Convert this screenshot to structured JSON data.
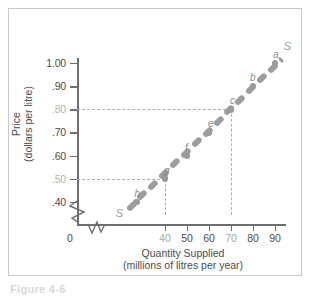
{
  "figure": {
    "caption": "Figure 4-6"
  },
  "chart_data": {
    "type": "line",
    "title": "",
    "xlabel": "Quantity Supplied",
    "xlabel_sub": "(millions of litres per year)",
    "ylabel": "Price",
    "ylabel_sub": "(dollars per litre)",
    "curve_label": "S",
    "curve_label_start": "S",
    "xlim": [
      0,
      95
    ],
    "ylim": [
      0.33,
      1.06
    ],
    "grid": false,
    "legend": "none",
    "axis_break_x": true,
    "axis_break_y": true,
    "xticks": [
      {
        "value": 0,
        "label": "0",
        "dim": false
      },
      {
        "value": 40,
        "label": "40",
        "dim": true
      },
      {
        "value": 50,
        "label": "50",
        "dim": false
      },
      {
        "value": 60,
        "label": "60",
        "dim": false
      },
      {
        "value": 70,
        "label": "70",
        "dim": true
      },
      {
        "value": 80,
        "label": "80",
        "dim": false
      },
      {
        "value": 90,
        "label": "90",
        "dim": false
      }
    ],
    "yticks": [
      {
        "value": 1.0,
        "label": "1.00",
        "dim": false
      },
      {
        "value": 0.9,
        "label": ".90",
        "dim": false
      },
      {
        "value": 0.8,
        "label": ".80",
        "dim": true
      },
      {
        "value": 0.7,
        "label": ".70",
        "dim": false
      },
      {
        "value": 0.6,
        "label": ".60",
        "dim": false
      },
      {
        "value": 0.5,
        "label": ".50",
        "dim": true
      },
      {
        "value": 0.4,
        "label": ".40",
        "dim": false
      }
    ],
    "points": [
      {
        "label": "h",
        "x": 27,
        "y": 0.4,
        "lab_dx": -2,
        "lab_dy": -14
      },
      {
        "label": "g",
        "x": 40,
        "y": 0.5,
        "lab_dx": -1,
        "lab_dy": -14
      },
      {
        "label": "f",
        "x": 50,
        "y": 0.6,
        "lab_dx": -2,
        "lab_dy": -14
      },
      {
        "label": "e",
        "x": 60,
        "y": 0.7,
        "lab_dx": -1,
        "lab_dy": -14
      },
      {
        "label": "c",
        "x": 70,
        "y": 0.8,
        "lab_dx": -1,
        "lab_dy": -14
      },
      {
        "label": "b",
        "x": 80,
        "y": 0.9,
        "lab_dx": -3,
        "lab_dy": -14
      },
      {
        "label": "a",
        "x": 90,
        "y": 1.0,
        "lab_dx": -2,
        "lab_dy": -14
      }
    ],
    "guides": [
      {
        "x": 40,
        "y": 0.5
      },
      {
        "x": 70,
        "y": 0.8
      }
    ],
    "curve_start": {
      "x": 23,
      "y": 0.365
    },
    "curve_end": {
      "x": 93,
      "y": 1.015
    }
  }
}
